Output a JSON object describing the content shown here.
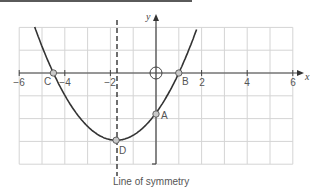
{
  "chart_data": {
    "type": "line",
    "title": "",
    "xlabel": "x",
    "ylabel": "y",
    "xlim": [
      -6,
      6
    ],
    "ylim": [
      -4,
      2
    ],
    "grid": true,
    "x_ticks": [
      -6,
      -4,
      -2,
      2,
      4,
      6
    ],
    "x_tick_labels": [
      "−6",
      "−4",
      "−2",
      "2",
      "4",
      "6"
    ],
    "origin_label": "O",
    "series": [
      {
        "name": "parabola",
        "equation": "y = 0.39(x + 1.75)^2 - 2.95",
        "x": [
          -5.3,
          -4.5,
          -4,
          -3,
          -2,
          -1.75,
          -1,
          0,
          1,
          1.8
        ],
        "y": [
          2.0,
          0.0,
          -0.98,
          -2.34,
          -2.93,
          -2.95,
          -2.73,
          -1.76,
          0.0,
          2.0
        ]
      }
    ],
    "points": [
      {
        "label": "A",
        "x": 0,
        "y": -1.8,
        "desc": "y-intercept"
      },
      {
        "label": "B",
        "x": 1,
        "y": 0,
        "desc": "root"
      },
      {
        "label": "C",
        "x": -4.5,
        "y": 0,
        "desc": "root"
      },
      {
        "label": "D",
        "x": -1.75,
        "y": -2.95,
        "desc": "vertex (minimum)"
      }
    ],
    "annotations": [
      {
        "type": "dashed-vertical-line",
        "x": -1.75,
        "label": "Line of symmetry"
      }
    ]
  },
  "labels": {
    "x_axis": "x",
    "y_axis": "y",
    "origin": "O",
    "caption": "Line of symmetry",
    "ticks": [
      "−6",
      "−4",
      "−2",
      "2",
      "4",
      "6"
    ],
    "points": {
      "A": "A",
      "B": "B",
      "C": "C",
      "D": "D"
    }
  },
  "colors": {
    "curve": "#333333",
    "grid": "#d4d4d4",
    "axis": "#444444",
    "point_fill": "#c8c8c8"
  }
}
